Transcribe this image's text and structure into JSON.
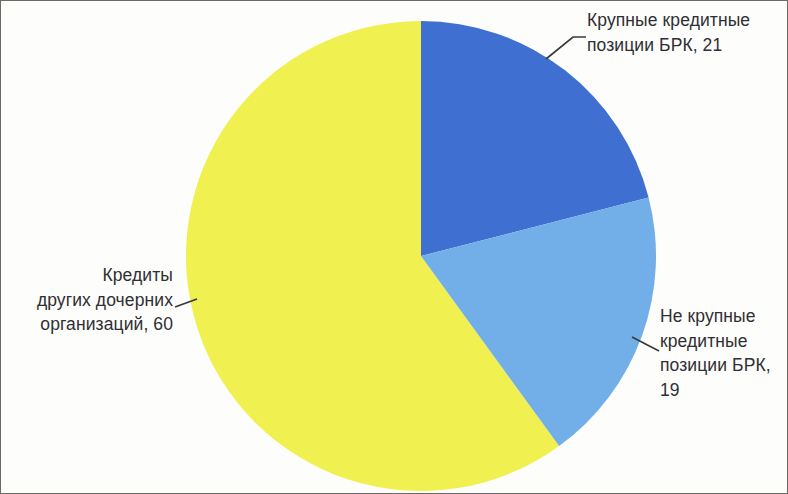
{
  "chart_data": {
    "type": "pie",
    "title": "",
    "subtitle": "",
    "xlabel": "",
    "ylabel": "",
    "legend_position": "none",
    "grid": false,
    "units": "%",
    "categories": [
      "Крупные кредитные позиции БРК",
      "Не крупные кредитные позиции БРК",
      "Кредиты других дочерних организаций"
    ],
    "values": [
      21,
      19,
      60
    ],
    "colors": [
      "#3f6fd0",
      "#72afe8",
      "#f0f050"
    ],
    "start_angle_deg": 0,
    "direction": "clockwise",
    "data_labels": [
      "Крупные кредитные\nпозиции БРК, 21",
      "Не крупные\nкредитные\nпозиции БРК,\n19",
      "Кредиты\nдругих дочерних\nорганизаций, 60"
    ],
    "slices": [
      {
        "name": "Крупные кредитные позиции БРК",
        "value": 21,
        "color": "#3f6fd0",
        "label": "Крупные кредитные\nпозиции БРК, 21"
      },
      {
        "name": "Не крупные кредитные позиции БРК",
        "value": 19,
        "color": "#72afe8",
        "label": "Не крупные\nкредитные\nпозиции БРК,\n19"
      },
      {
        "name": "Кредиты других дочерних организаций",
        "value": 60,
        "color": "#f0f050",
        "label": "Кредиты\nдругих дочерних\nорганизаций, 60"
      }
    ]
  },
  "labels": {
    "large_credit_positions": "Крупные кредитные\nпозиции БРК, 21",
    "small_credit_positions": "Не крупные\nкредитные\nпозиции БРК,\n19",
    "other_subsidiary_credits": "Кредиты\nдругих дочерних\nорганизаций, 60"
  },
  "style": {
    "text_color": "#2f2f33",
    "background": "#fdfdfb",
    "border_color": "#6b6b63",
    "leader_line_color": "#3a3a3a"
  }
}
